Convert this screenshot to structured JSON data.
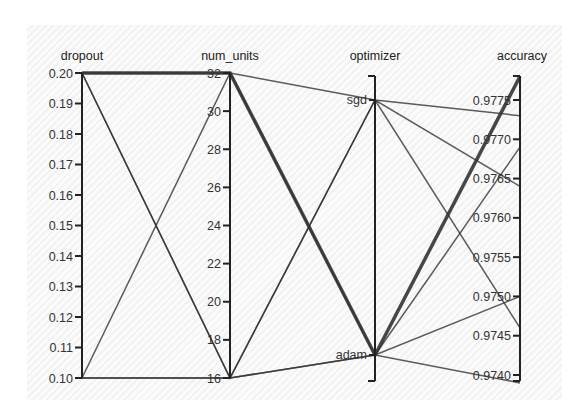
{
  "chart_data": {
    "type": "parallel_coordinates",
    "title": "",
    "dimensions": [
      {
        "name": "dropout",
        "type": "numeric",
        "range": [
          0.1,
          0.2
        ],
        "ticks": [
          "0.20",
          "0.19",
          "0.18",
          "0.17",
          "0.16",
          "0.15",
          "0.14",
          "0.13",
          "0.12",
          "0.11",
          "0.10"
        ],
        "tick_values": [
          0.2,
          0.19,
          0.18,
          0.17,
          0.16,
          0.15,
          0.14,
          0.13,
          0.12,
          0.11,
          0.1
        ]
      },
      {
        "name": "num_units",
        "type": "numeric",
        "range": [
          16,
          32
        ],
        "ticks": [
          "32",
          "30",
          "28",
          "26",
          "24",
          "22",
          "20",
          "18",
          "16"
        ],
        "tick_values": [
          32,
          30,
          28,
          26,
          24,
          22,
          20,
          18,
          16
        ]
      },
      {
        "name": "optimizer",
        "type": "categorical",
        "categories": [
          "sgd",
          "adam"
        ]
      },
      {
        "name": "accuracy",
        "type": "numeric",
        "range": [
          0.9739,
          0.9778
        ],
        "ticks": [
          "0.9775",
          "0.9770",
          "0.9765",
          "0.9760",
          "0.9755",
          "0.9750",
          "0.9745",
          "0.9740"
        ],
        "tick_values": [
          0.9775,
          0.977,
          0.9765,
          0.976,
          0.9755,
          0.975,
          0.9745,
          0.974
        ]
      }
    ],
    "series": [
      {
        "dropout": 0.2,
        "num_units": 32,
        "optimizer": "adam",
        "accuracy": 0.9778,
        "highlight": true
      },
      {
        "dropout": 0.2,
        "num_units": 32,
        "optimizer": "sgd",
        "accuracy": 0.9773
      },
      {
        "dropout": 0.2,
        "num_units": 16,
        "optimizer": "sgd",
        "accuracy": 0.9764
      },
      {
        "dropout": 0.1,
        "num_units": 32,
        "optimizer": "adam",
        "accuracy": 0.9769
      },
      {
        "dropout": 0.1,
        "num_units": 16,
        "optimizer": "sgd",
        "accuracy": 0.9746
      },
      {
        "dropout": 0.2,
        "num_units": 16,
        "optimizer": "adam",
        "accuracy": 0.975
      },
      {
        "dropout": 0.1,
        "num_units": 16,
        "optimizer": "adam",
        "accuracy": 0.9739
      }
    ],
    "grid": false,
    "legend": null,
    "line_color": "#333333"
  },
  "axes_titles": {
    "dropout": "dropout",
    "num_units": "num_units",
    "optimizer": "optimizer",
    "accuracy": "accuracy"
  }
}
